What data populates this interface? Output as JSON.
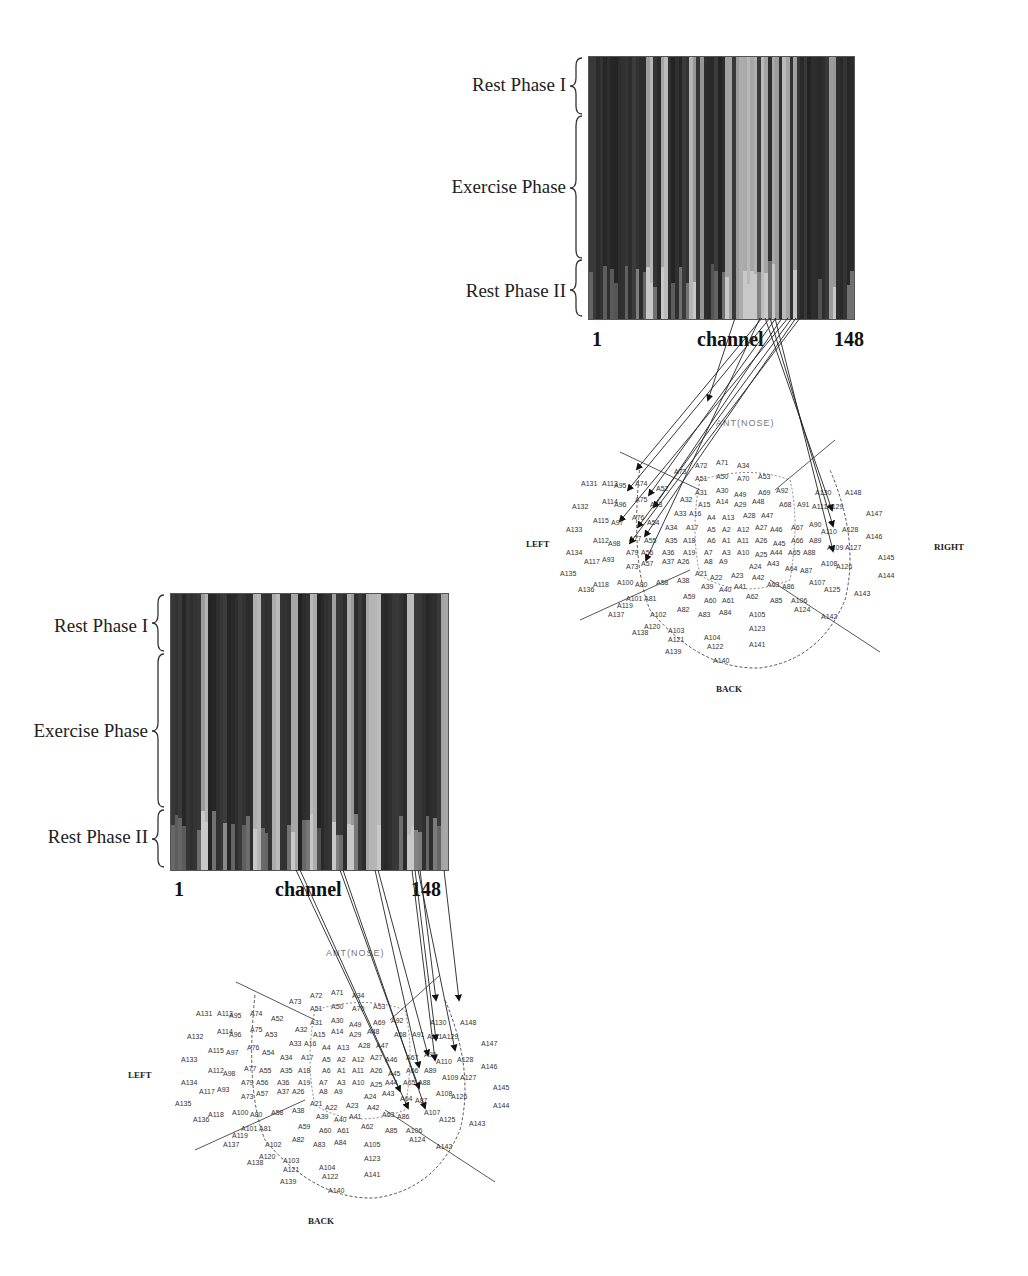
{
  "figure": {
    "phase_labels": [
      "Rest Phase I",
      "Exercise Phase",
      "Rest Phase II"
    ],
    "axis": {
      "start": "1",
      "label": "channel",
      "end": "148"
    },
    "directions": {
      "left": "LEFT",
      "right": "RIGHT",
      "back": "BACK",
      "front": "ANT(NOSE)"
    }
  },
  "panels": [
    {
      "id": "top",
      "phase_labels": [
        "Rest Phase I",
        "Exercise Phase",
        "Rest Phase II"
      ],
      "axis_start": "1",
      "axis_label": "channel",
      "axis_end": "148",
      "map_labels": {
        "left": "LEFT",
        "right": "RIGHT",
        "back": "BACK",
        "front": "ANT(NOSE)"
      }
    },
    {
      "id": "bottom",
      "phase_labels": [
        "Rest Phase I",
        "Exercise Phase",
        "Rest Phase II"
      ],
      "axis_start": "1",
      "axis_label": "channel",
      "axis_end": "148",
      "map_labels": {
        "left": "LEFT",
        "back": "BACK",
        "front": "ANT(NOSE)"
      }
    }
  ],
  "sensors": [
    [
      "A72",
      0.4,
      0.05
    ],
    [
      "A71",
      0.47,
      0.04
    ],
    [
      "A34",
      0.54,
      0.05
    ],
    [
      "A73",
      0.33,
      0.08
    ],
    [
      "A51",
      0.4,
      0.11
    ],
    [
      "A50",
      0.47,
      0.1
    ],
    [
      "A70",
      0.54,
      0.11
    ],
    [
      "A53",
      0.61,
      0.1
    ],
    [
      "A131",
      0.02,
      0.13
    ],
    [
      "A113",
      0.09,
      0.13
    ],
    [
      "A95",
      0.13,
      0.14
    ],
    [
      "A74",
      0.2,
      0.13
    ],
    [
      "A52",
      0.27,
      0.15
    ],
    [
      "A31",
      0.4,
      0.17
    ],
    [
      "A30",
      0.47,
      0.16
    ],
    [
      "A49",
      0.53,
      0.18
    ],
    [
      "A69",
      0.61,
      0.17
    ],
    [
      "A92",
      0.67,
      0.16
    ],
    [
      "A130",
      0.8,
      0.17
    ],
    [
      "A148",
      0.9,
      0.17
    ],
    [
      "A114",
      0.09,
      0.21
    ],
    [
      "A96",
      0.13,
      0.22
    ],
    [
      "A75",
      0.2,
      0.2
    ],
    [
      "A53",
      0.25,
      0.22
    ],
    [
      "A32",
      0.35,
      0.2
    ],
    [
      "A15",
      0.41,
      0.22
    ],
    [
      "A14",
      0.47,
      0.21
    ],
    [
      "A29",
      0.53,
      0.22
    ],
    [
      "A48",
      0.59,
      0.21
    ],
    [
      "A68",
      0.68,
      0.22
    ],
    [
      "A91",
      0.74,
      0.22
    ],
    [
      "A111",
      0.79,
      0.23
    ],
    [
      "A129",
      0.84,
      0.23
    ],
    [
      "A132",
      -0.01,
      0.23
    ],
    [
      "A115",
      0.06,
      0.29
    ],
    [
      "A97",
      0.12,
      0.3
    ],
    [
      "A76",
      0.19,
      0.28
    ],
    [
      "A54",
      0.24,
      0.3
    ],
    [
      "A33",
      0.33,
      0.26
    ],
    [
      "A16",
      0.38,
      0.26
    ],
    [
      "A4",
      0.44,
      0.28
    ],
    [
      "A13",
      0.49,
      0.28
    ],
    [
      "A28",
      0.56,
      0.27
    ],
    [
      "A47",
      0.62,
      0.27
    ],
    [
      "A147",
      0.97,
      0.26
    ],
    [
      "A133",
      -0.03,
      0.33
    ],
    [
      "A34",
      0.3,
      0.32
    ],
    [
      "A17",
      0.37,
      0.32
    ],
    [
      "A5",
      0.44,
      0.33
    ],
    [
      "A2",
      0.49,
      0.33
    ],
    [
      "A12",
      0.54,
      0.33
    ],
    [
      "A27",
      0.6,
      0.32
    ],
    [
      "A46",
      0.65,
      0.33
    ],
    [
      "A67",
      0.72,
      0.32
    ],
    [
      "A90",
      0.78,
      0.31
    ],
    [
      "A110",
      0.82,
      0.34
    ],
    [
      "A128",
      0.89,
      0.33
    ],
    [
      "A112",
      0.06,
      0.38
    ],
    [
      "A98",
      0.11,
      0.39
    ],
    [
      "A77",
      0.18,
      0.37
    ],
    [
      "A55",
      0.23,
      0.38
    ],
    [
      "A35",
      0.3,
      0.38
    ],
    [
      "A18",
      0.36,
      0.38
    ],
    [
      "A6",
      0.44,
      0.38
    ],
    [
      "A1",
      0.49,
      0.38
    ],
    [
      "A11",
      0.54,
      0.38
    ],
    [
      "A26",
      0.6,
      0.38
    ],
    [
      "A45",
      0.66,
      0.39
    ],
    [
      "A66",
      0.72,
      0.38
    ],
    [
      "A89",
      0.78,
      0.38
    ],
    [
      "A146",
      0.97,
      0.36
    ],
    [
      "A134",
      -0.03,
      0.43
    ],
    [
      "A79",
      0.17,
      0.43
    ],
    [
      "A56",
      0.22,
      0.43
    ],
    [
      "A36",
      0.29,
      0.43
    ],
    [
      "A19",
      0.36,
      0.43
    ],
    [
      "A7",
      0.43,
      0.43
    ],
    [
      "A3",
      0.49,
      0.43
    ],
    [
      "A10",
      0.54,
      0.43
    ],
    [
      "A25",
      0.6,
      0.44
    ],
    [
      "A44",
      0.65,
      0.43
    ],
    [
      "A65",
      0.71,
      0.43
    ],
    [
      "A88",
      0.76,
      0.43
    ],
    [
      "A109",
      0.84,
      0.41
    ],
    [
      "A127",
      0.9,
      0.41
    ],
    [
      "A117",
      0.03,
      0.47
    ],
    [
      "A93",
      0.09,
      0.46
    ],
    [
      "A73",
      0.17,
      0.49
    ],
    [
      "A57",
      0.22,
      0.48
    ],
    [
      "A37",
      0.29,
      0.47
    ],
    [
      "A26",
      0.34,
      0.47
    ],
    [
      "A8",
      0.43,
      0.47
    ],
    [
      "A9",
      0.48,
      0.47
    ],
    [
      "A24",
      0.58,
      0.49
    ],
    [
      "A43",
      0.64,
      0.48
    ],
    [
      "A64",
      0.7,
      0.5
    ],
    [
      "A87",
      0.75,
      0.51
    ],
    [
      "A108",
      0.82,
      0.48
    ],
    [
      "A126",
      0.87,
      0.49
    ],
    [
      "A145",
      1.01,
      0.45
    ],
    [
      "A135",
      -0.05,
      0.52
    ],
    [
      "A21",
      0.4,
      0.52
    ],
    [
      "A22",
      0.45,
      0.54
    ],
    [
      "A23",
      0.52,
      0.53
    ],
    [
      "A42",
      0.59,
      0.54
    ],
    [
      "A144",
      1.01,
      0.53
    ],
    [
      "A100",
      0.14,
      0.56
    ],
    [
      "A118",
      0.06,
      0.57
    ],
    [
      "A80",
      0.2,
      0.57
    ],
    [
      "A58",
      0.27,
      0.56
    ],
    [
      "A38",
      0.34,
      0.55
    ],
    [
      "A39",
      0.42,
      0.58
    ],
    [
      "A40",
      0.48,
      0.59
    ],
    [
      "A41",
      0.53,
      0.58
    ],
    [
      "A63",
      0.64,
      0.57
    ],
    [
      "A86",
      0.69,
      0.58
    ],
    [
      "A107",
      0.78,
      0.56
    ],
    [
      "A125",
      0.83,
      0.59
    ],
    [
      "A143",
      0.93,
      0.61
    ],
    [
      "A136",
      0.01,
      0.59
    ],
    [
      "A59",
      0.36,
      0.62
    ],
    [
      "A60",
      0.43,
      0.64
    ],
    [
      "A61",
      0.49,
      0.64
    ],
    [
      "A62",
      0.57,
      0.62
    ],
    [
      "A85",
      0.65,
      0.64
    ],
    [
      "A106",
      0.72,
      0.64
    ],
    [
      "A101",
      0.17,
      0.63
    ],
    [
      "A81",
      0.23,
      0.63
    ],
    [
      "A119",
      0.14,
      0.66
    ],
    [
      "A137",
      0.11,
      0.7
    ],
    [
      "A82",
      0.34,
      0.68
    ],
    [
      "A83",
      0.41,
      0.7
    ],
    [
      "A84",
      0.48,
      0.69
    ],
    [
      "A105",
      0.58,
      0.7
    ],
    [
      "A124",
      0.73,
      0.68
    ],
    [
      "A142",
      0.82,
      0.71
    ],
    [
      "A102",
      0.25,
      0.7
    ],
    [
      "A120",
      0.23,
      0.75
    ],
    [
      "A138",
      0.19,
      0.78
    ],
    [
      "A103",
      0.31,
      0.77
    ],
    [
      "A104",
      0.43,
      0.8
    ],
    [
      "A123",
      0.58,
      0.76
    ],
    [
      "A121",
      0.31,
      0.81
    ],
    [
      "A122",
      0.44,
      0.84
    ],
    [
      "A141",
      0.58,
      0.83
    ],
    [
      "A139",
      0.3,
      0.86
    ],
    [
      "A140",
      0.46,
      0.9
    ]
  ],
  "chart_data": [
    {
      "type": "heatmap",
      "title": "",
      "xlabel": "channel",
      "x_ticks": [
        "1",
        "148"
      ],
      "ylabel": "",
      "y_regions": [
        "Rest Phase I",
        "Exercise Phase",
        "Rest Phase II"
      ],
      "colormap": "grayscale",
      "x_range": [
        1,
        148
      ],
      "bright_channel_fraction_positions": [
        0.22,
        0.28,
        0.38,
        0.42,
        0.52,
        0.56,
        0.59,
        0.62,
        0.66,
        0.7,
        0.74,
        0.77,
        0.91
      ],
      "note": "Top panel: channel intensity over time across rest/exercise/rest phases, linked to 148-sensor MEG head layout"
    },
    {
      "type": "heatmap",
      "title": "",
      "xlabel": "channel",
      "x_ticks": [
        "1",
        "148"
      ],
      "ylabel": "",
      "y_regions": [
        "Rest Phase I",
        "Exercise Phase",
        "Rest Phase II"
      ],
      "colormap": "grayscale",
      "x_range": [
        1,
        148
      ],
      "bright_channel_fraction_positions": [
        0.12,
        0.3,
        0.37,
        0.44,
        0.51,
        0.58,
        0.64,
        0.71,
        0.74,
        0.86,
        0.98
      ],
      "note": "Bottom panel: second subject/condition, arrows link bright channels to right-frontal sensors"
    }
  ]
}
